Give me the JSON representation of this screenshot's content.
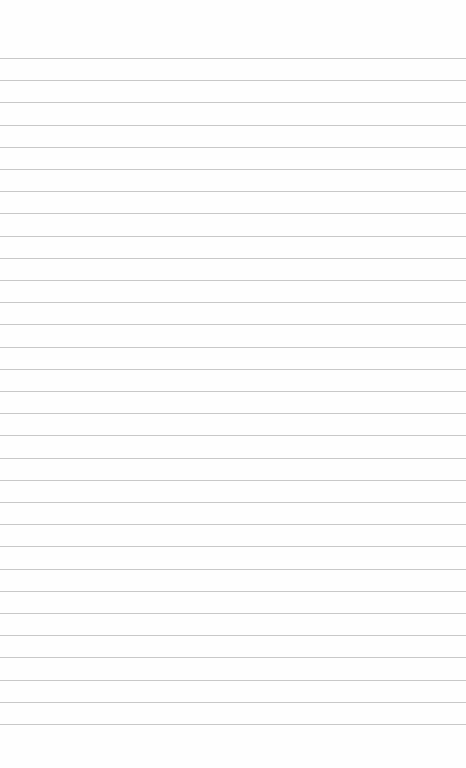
{
  "page": {
    "type": "lined-paper",
    "background_color": "#fefefe",
    "line_color": "#c8c8c8",
    "line_count": 31,
    "first_line_y": 58,
    "line_spacing": 22.2
  }
}
